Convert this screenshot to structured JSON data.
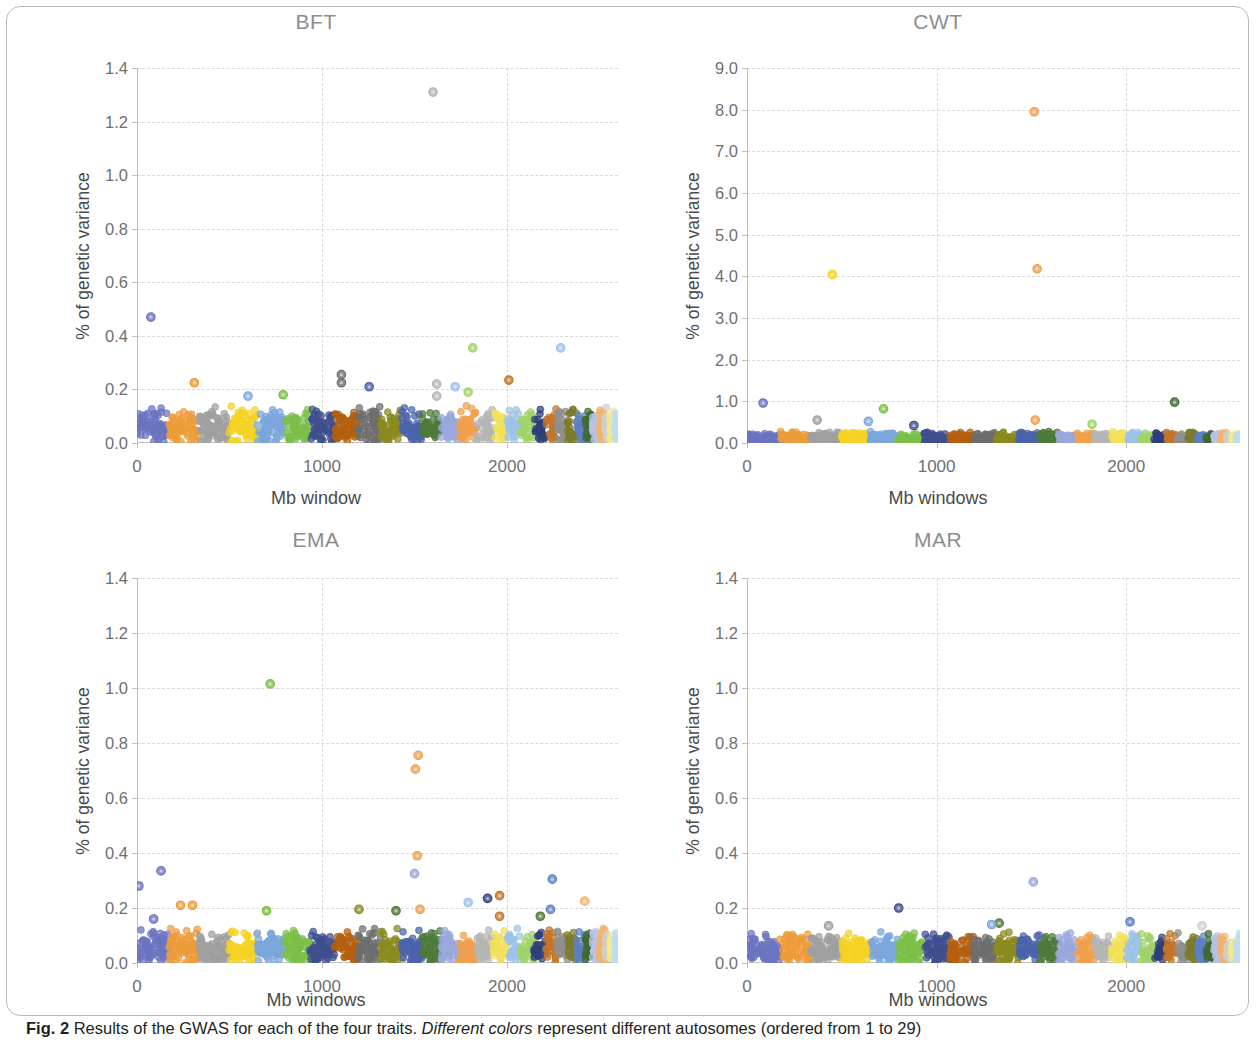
{
  "figure": {
    "caption_label": "Fig. 2",
    "caption_text_1": "Results of the GWAS for each of the four traits.",
    "caption_emph": "Different colors",
    "caption_text_2": "represent different autosomes (ordered from 1 to 29)"
  },
  "palette": {
    "autosome_colors": [
      "#6b74c0",
      "#ed9c3a",
      "#a0a0a0",
      "#f5d222",
      "#7aa6dd",
      "#7bbf4a",
      "#3f4f8f",
      "#b4600f",
      "#6e6e6e",
      "#8a8a20",
      "#4a63ab",
      "#4d7a3a",
      "#9aa8dd",
      "#f0a04b",
      "#b5b5b5",
      "#f2e05a",
      "#9cc3e8",
      "#9fd36a",
      "#2f3f7a",
      "#c4762a",
      "#8f8f8f",
      "#7b7b2a",
      "#5f7fc4",
      "#3f6b32",
      "#b8c2e8",
      "#f3b36d",
      "#cfcfcf",
      "#f7ea8c",
      "#bcdcf2"
    ],
    "grid_color": "#d9d9d9",
    "axis_color": "#bfbfbf",
    "title_color": "#8d8d8d",
    "tick_text_color": "#6f6f6f",
    "axis_label_color": "#4a4a4a"
  },
  "chart_data": [
    {
      "type": "scatter",
      "panel_id": "bft",
      "title": "BFT",
      "xlabel": "Mb window",
      "ylabel": "% of genetic variance",
      "xlim": [
        0,
        2600
      ],
      "ylim": [
        0,
        1.4
      ],
      "xticks": [
        0,
        1000,
        2000
      ],
      "xtick_labels": [
        "0",
        "1000",
        "2000"
      ],
      "yticks": [
        0.0,
        0.2,
        0.4,
        0.6,
        0.8,
        1.0,
        1.2,
        1.4
      ],
      "ytick_labels": [
        "0.0",
        "0.2",
        "0.4",
        "0.6",
        "0.8",
        "1.0",
        "1.2",
        "1.4"
      ],
      "grid": true,
      "legend": "none",
      "baseline_max": 0.14,
      "notable_points": [
        {
          "x": 1600,
          "y": 1.31,
          "autosome": 21,
          "color": "#b5b5b5"
        },
        {
          "x": 75,
          "y": 0.47,
          "autosome": 1,
          "color": "#6b74c0"
        },
        {
          "x": 1815,
          "y": 0.355,
          "autosome": 18,
          "color": "#9fd36a"
        },
        {
          "x": 2290,
          "y": 0.355,
          "autosome": 23,
          "color": "#9cc3e8"
        },
        {
          "x": 1105,
          "y": 0.255,
          "autosome": 9,
          "color": "#6e6e6e"
        },
        {
          "x": 1105,
          "y": 0.225,
          "autosome": 9,
          "color": "#6e6e6e"
        },
        {
          "x": 310,
          "y": 0.225,
          "autosome": 2,
          "color": "#ed9c3a"
        },
        {
          "x": 2010,
          "y": 0.235,
          "autosome": 20,
          "color": "#c4762a"
        },
        {
          "x": 1620,
          "y": 0.22,
          "autosome": 21,
          "color": "#b5b5b5"
        },
        {
          "x": 1620,
          "y": 0.175,
          "autosome": 21,
          "color": "#b5b5b5"
        },
        {
          "x": 1720,
          "y": 0.21,
          "autosome": 17,
          "color": "#9cc3e8"
        },
        {
          "x": 1790,
          "y": 0.19,
          "autosome": 18,
          "color": "#9fd36a"
        },
        {
          "x": 1255,
          "y": 0.21,
          "autosome": 11,
          "color": "#4a63ab"
        },
        {
          "x": 790,
          "y": 0.18,
          "autosome": 7,
          "color": "#7bbf4a"
        },
        {
          "x": 600,
          "y": 0.175,
          "autosome": 5,
          "color": "#7aa6dd"
        }
      ]
    },
    {
      "type": "scatter",
      "panel_id": "cwt",
      "title": "CWT",
      "xlabel": "Mb windows",
      "ylabel": "% of genetic variance",
      "xlim": [
        0,
        2600
      ],
      "ylim": [
        0,
        9.0
      ],
      "xticks": [
        0,
        1000,
        2000
      ],
      "xtick_labels": [
        "0",
        "1000",
        "2000"
      ],
      "yticks": [
        0.0,
        1.0,
        2.0,
        3.0,
        4.0,
        5.0,
        6.0,
        7.0,
        8.0,
        9.0
      ],
      "ytick_labels": [
        "0.0",
        "1.0",
        "2.0",
        "3.0",
        "4.0",
        "5.0",
        "6.0",
        "7.0",
        "8.0",
        "9.0"
      ],
      "grid": true,
      "legend": "none",
      "baseline_max": 0.28,
      "notable_points": [
        {
          "x": 1515,
          "y": 7.95,
          "autosome": 14,
          "color": "#f0a04b"
        },
        {
          "x": 1530,
          "y": 4.18,
          "autosome": 14,
          "color": "#f0a04b"
        },
        {
          "x": 450,
          "y": 4.04,
          "autosome": 4,
          "color": "#f5d222"
        },
        {
          "x": 85,
          "y": 0.96,
          "autosome": 1,
          "color": "#6b74c0"
        },
        {
          "x": 2255,
          "y": 0.98,
          "autosome": 24,
          "color": "#3f6b32"
        },
        {
          "x": 720,
          "y": 0.82,
          "autosome": 6,
          "color": "#7bbf4a"
        },
        {
          "x": 1520,
          "y": 0.55,
          "autosome": 14,
          "color": "#f0a04b"
        },
        {
          "x": 370,
          "y": 0.55,
          "autosome": 3,
          "color": "#a0a0a0"
        },
        {
          "x": 640,
          "y": 0.52,
          "autosome": 5,
          "color": "#7aa6dd"
        },
        {
          "x": 1820,
          "y": 0.45,
          "autosome": 18,
          "color": "#9fd36a"
        },
        {
          "x": 880,
          "y": 0.42,
          "autosome": 7,
          "color": "#3f4f8f"
        }
      ]
    },
    {
      "type": "scatter",
      "panel_id": "ema",
      "title": "EMA",
      "xlabel": "Mb windows",
      "ylabel": "% of genetic variance",
      "xlim": [
        0,
        2600
      ],
      "ylim": [
        0,
        1.4
      ],
      "xticks": [
        0,
        1000,
        2000
      ],
      "xtick_labels": [
        "0",
        "1000",
        "2000"
      ],
      "yticks": [
        0.0,
        0.2,
        0.4,
        0.6,
        0.8,
        1.0,
        1.2,
        1.4
      ],
      "ytick_labels": [
        "0.0",
        "0.2",
        "0.4",
        "0.6",
        "0.8",
        "1.0",
        "1.2",
        "1.4"
      ],
      "grid": true,
      "legend": "none",
      "baseline_max": 0.13,
      "notable_points": [
        {
          "x": 720,
          "y": 1.015,
          "autosome": 6,
          "color": "#7bbf4a"
        },
        {
          "x": 1520,
          "y": 0.755,
          "autosome": 14,
          "color": "#f0a04b"
        },
        {
          "x": 1505,
          "y": 0.705,
          "autosome": 14,
          "color": "#f0a04b"
        },
        {
          "x": 1515,
          "y": 0.39,
          "autosome": 14,
          "color": "#f0a04b"
        },
        {
          "x": 1500,
          "y": 0.325,
          "autosome": 13,
          "color": "#9aa8dd"
        },
        {
          "x": 130,
          "y": 0.335,
          "autosome": 1,
          "color": "#6b74c0"
        },
        {
          "x": 10,
          "y": 0.28,
          "autosome": 1,
          "color": "#6b74c0"
        },
        {
          "x": 2245,
          "y": 0.305,
          "autosome": 23,
          "color": "#5f7fc4"
        },
        {
          "x": 1960,
          "y": 0.245,
          "autosome": 20,
          "color": "#c4762a"
        },
        {
          "x": 1895,
          "y": 0.235,
          "autosome": 19,
          "color": "#2f3f7a"
        },
        {
          "x": 2420,
          "y": 0.225,
          "autosome": 26,
          "color": "#f3b36d"
        },
        {
          "x": 235,
          "y": 0.21,
          "autosome": 2,
          "color": "#ed9c3a"
        },
        {
          "x": 300,
          "y": 0.21,
          "autosome": 2,
          "color": "#ed9c3a"
        },
        {
          "x": 1790,
          "y": 0.22,
          "autosome": 17,
          "color": "#9cc3e8"
        },
        {
          "x": 1200,
          "y": 0.195,
          "autosome": 10,
          "color": "#8a8a20"
        },
        {
          "x": 1530,
          "y": 0.195,
          "autosome": 14,
          "color": "#f0a04b"
        },
        {
          "x": 1400,
          "y": 0.19,
          "autosome": 12,
          "color": "#4d7a3a"
        },
        {
          "x": 2235,
          "y": 0.195,
          "autosome": 23,
          "color": "#5f7fc4"
        },
        {
          "x": 2180,
          "y": 0.17,
          "autosome": 22,
          "color": "#4d7a3a"
        },
        {
          "x": 1960,
          "y": 0.17,
          "autosome": 20,
          "color": "#c4762a"
        },
        {
          "x": 90,
          "y": 0.16,
          "autosome": 1,
          "color": "#6b74c0"
        },
        {
          "x": 700,
          "y": 0.19,
          "autosome": 6,
          "color": "#7bbf4a"
        }
      ]
    },
    {
      "type": "scatter",
      "panel_id": "mar",
      "title": "MAR",
      "xlabel": "Mb windows",
      "ylabel": "% of genetic variance",
      "xlim": [
        0,
        2600
      ],
      "ylim": [
        0,
        1.4
      ],
      "xticks": [
        0,
        1000,
        2000
      ],
      "xtick_labels": [
        "0",
        "1000",
        "2000"
      ],
      "yticks": [
        0.0,
        0.2,
        0.4,
        0.6,
        0.8,
        1.0,
        1.2,
        1.4
      ],
      "ytick_labels": [
        "0.0",
        "0.2",
        "0.4",
        "0.6",
        "0.8",
        "1.0",
        "1.2",
        "1.4"
      ],
      "grid": true,
      "legend": "none",
      "baseline_max": 0.115,
      "notable_points": [
        {
          "x": 1510,
          "y": 0.295,
          "autosome": 13,
          "color": "#9aa8dd"
        },
        {
          "x": 800,
          "y": 0.2,
          "autosome": 7,
          "color": "#3f4f8f"
        },
        {
          "x": 1330,
          "y": 0.145,
          "autosome": 12,
          "color": "#4d7a3a"
        },
        {
          "x": 1290,
          "y": 0.14,
          "autosome": 11,
          "color": "#7aa6dd"
        },
        {
          "x": 2020,
          "y": 0.15,
          "autosome": 20,
          "color": "#5f7fc4"
        },
        {
          "x": 430,
          "y": 0.135,
          "autosome": 3,
          "color": "#a0a0a0"
        },
        {
          "x": 2400,
          "y": 0.135,
          "autosome": 26,
          "color": "#cfcfcf"
        }
      ]
    }
  ]
}
